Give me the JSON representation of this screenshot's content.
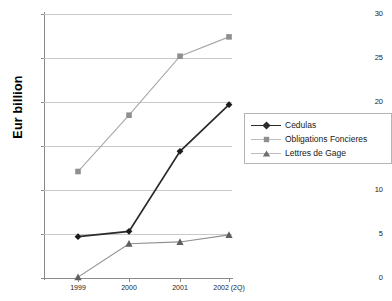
{
  "chart_data": {
    "type": "line",
    "title": "",
    "xlabel": "",
    "ylabel": "Eur billion",
    "categories": [
      "1999",
      "2000",
      "2001",
      "2002 (2Q)"
    ],
    "ylim": [
      0,
      30
    ],
    "yticks": [
      "0",
      "5",
      "10",
      "15",
      "20",
      "25",
      "30"
    ],
    "grid": "horizontal",
    "legend_position": "right",
    "series": [
      {
        "name": "Cedulas",
        "marker": "diamond",
        "color": "#2b2b2b",
        "values": [
          4.7,
          5.3,
          14.4,
          19.7
        ]
      },
      {
        "name": "Obligations Foncieres",
        "marker": "square",
        "color": "#a8a8a8",
        "values": [
          12.1,
          18.5,
          25.2,
          27.4
        ]
      },
      {
        "name": "Lettres de Gage",
        "marker": "triangle",
        "color": "#8f8f8f",
        "values": [
          0.1,
          3.9,
          4.1,
          4.9
        ]
      }
    ]
  },
  "axis": {
    "y_title": "Eur billion"
  },
  "legend": {
    "items": [
      {
        "label": "Cedulas"
      },
      {
        "label": "Obligations Foncieres"
      },
      {
        "label": "Lettres de Gage"
      }
    ]
  },
  "colors": {
    "gridline": "#c9c9c9",
    "axis": "#8a8a8a",
    "background": "#ffffff",
    "series_dark": "#2b2b2b",
    "series_light_gray": "#a8a8a8",
    "series_gray": "#8f8f8f"
  }
}
